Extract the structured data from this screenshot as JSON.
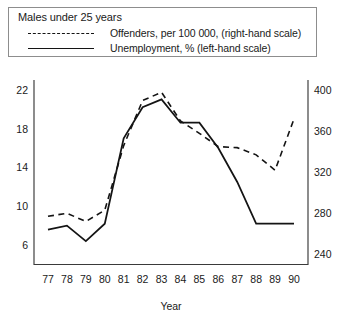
{
  "legend": {
    "title": "Males under 25 years",
    "entries": [
      {
        "label": "Offenders, per 100 000, (right-hand scale)",
        "style": "dashed",
        "swatch_name": "dashed-line-swatch"
      },
      {
        "label": "Unemployment, % (left-hand scale)",
        "style": "solid",
        "swatch_name": "solid-line-swatch"
      }
    ]
  },
  "chart_data": {
    "type": "line",
    "title": "Males under 25 years",
    "xlabel": "Year",
    "ylabel": "",
    "grid": false,
    "legend_position": "top",
    "x": [
      "77",
      "78",
      "79",
      "80",
      "81",
      "82",
      "83",
      "84",
      "85",
      "86",
      "87",
      "88",
      "89",
      "90"
    ],
    "categories": [
      "77",
      "78",
      "79",
      "80",
      "81",
      "82",
      "83",
      "84",
      "85",
      "86",
      "87",
      "88",
      "89",
      "90"
    ],
    "xtick_labels": [
      "77",
      "78",
      "79",
      "80",
      "81",
      "82",
      "83",
      "84",
      "85",
      "86",
      "87",
      "88",
      "89",
      "90"
    ],
    "left_axis": {
      "label": "Unemployment, %",
      "ticks": [
        6,
        10,
        14,
        18,
        22
      ],
      "tick_labels": [
        "6",
        "10",
        "14",
        "18",
        "22"
      ],
      "ylim": [
        4,
        23
      ]
    },
    "right_axis": {
      "label": "Offenders, per 100 000",
      "ticks": [
        240,
        280,
        320,
        360,
        400
      ],
      "tick_labels": [
        "240",
        "280",
        "320",
        "360",
        "400"
      ],
      "ylim": [
        230,
        410
      ]
    },
    "series": [
      {
        "name": "Unemployment, % (left-hand scale)",
        "axis": "left",
        "style": "solid",
        "values": [
          7.6,
          8.0,
          6.4,
          8.2,
          17.0,
          20.2,
          21.0,
          18.6,
          18.6,
          16.0,
          12.5,
          8.2,
          8.2,
          8.2
        ]
      },
      {
        "name": "Offenders, per 100 000, (right-hand scale)",
        "axis": "right",
        "style": "dashed",
        "values": [
          277,
          280,
          272,
          283,
          346,
          390,
          398,
          370,
          358,
          345,
          344,
          337,
          322,
          372
        ]
      }
    ]
  }
}
